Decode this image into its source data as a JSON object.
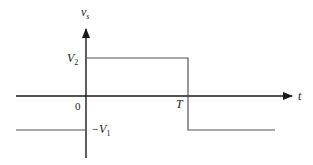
{
  "diagram": {
    "type": "square-pulse-waveform",
    "y_axis_label": "v",
    "y_axis_label_sub": "s",
    "x_axis_label": "t",
    "origin_label": "0",
    "high_level_label": "V",
    "high_level_sub": "2",
    "low_level_prefix": "−V",
    "low_level_sub": "1",
    "transition_label": "T",
    "colors": {
      "axis": "#1a1a1a",
      "waveform": "#555555",
      "background": "#ffffff"
    }
  }
}
